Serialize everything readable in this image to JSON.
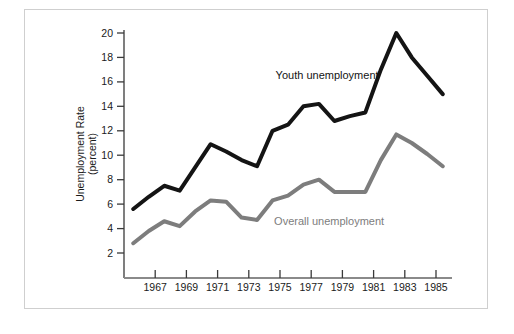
{
  "chart_data": {
    "type": "line",
    "title": "",
    "subtitle": "",
    "xlabel": "",
    "ylabel": "Unemployment Rate\n(percent)",
    "ylabel_line1": "Unemployment Rate",
    "ylabel_line2": "(percent)",
    "x": [
      1966,
      1967,
      1968,
      1969,
      1970,
      1971,
      1972,
      1973,
      1974,
      1975,
      1976,
      1977,
      1978,
      1979,
      1980,
      1981,
      1982,
      1983,
      1984,
      1985,
      1986
    ],
    "xlim": [
      1965.4,
      1986.6
    ],
    "ylim": [
      0,
      21
    ],
    "yticks": [
      2,
      4,
      6,
      8,
      10,
      12,
      14,
      16,
      18,
      20
    ],
    "ytick_labels": [
      "2",
      "4",
      "6",
      "8",
      "10",
      "12",
      "14",
      "16",
      "18",
      "20"
    ],
    "xticks": [
      1967,
      1969,
      1971,
      1973,
      1975,
      1977,
      1979,
      1981,
      1983,
      1985
    ],
    "xtick_labels": [
      "1967",
      "1969",
      "1971",
      "1973",
      "1975",
      "1977",
      "1979",
      "1981",
      "1983",
      "1985"
    ],
    "xminor_ticks": [
      1966,
      1968,
      1970,
      1972,
      1974,
      1976,
      1978,
      1980,
      1982,
      1984,
      1986
    ],
    "grid": false,
    "legend_position": "inline-annotations",
    "series": [
      {
        "name": "Youth unemployment",
        "color": "#141414",
        "linewidth": 4.0,
        "values": [
          5.6,
          6.6,
          7.5,
          7.1,
          9.0,
          10.9,
          10.3,
          9.6,
          9.1,
          12.0,
          12.5,
          14.0,
          14.2,
          12.8,
          13.2,
          13.5,
          17.0,
          20.0,
          18.0,
          16.5,
          15.0
        ]
      },
      {
        "name": "Overall unemployment",
        "color": "#7d7d7d",
        "linewidth": 4.0,
        "values": [
          2.8,
          3.8,
          4.6,
          4.2,
          5.4,
          6.3,
          6.2,
          4.9,
          4.7,
          6.3,
          6.7,
          7.6,
          8.0,
          7.0,
          7.0,
          7.0,
          9.6,
          11.7,
          11.0,
          10.1,
          9.1
        ]
      }
    ],
    "annotations": [
      {
        "text": "Youth unemployment",
        "x": 1975.2,
        "y": 16.2,
        "color": "#141414",
        "series": "Youth unemployment"
      },
      {
        "text": "Overall unemployment",
        "x": 1975.1,
        "y": 4.3,
        "color": "#7d7d7d",
        "series": "Overall unemployment"
      }
    ]
  },
  "figure": {
    "background_color": "#ffffff",
    "frame_color": "#cfcfcf",
    "axis_color": "#3a3a3a",
    "axis_line_color_x": "#8a8a8a",
    "tick_label_color": "#1a1a1a"
  }
}
